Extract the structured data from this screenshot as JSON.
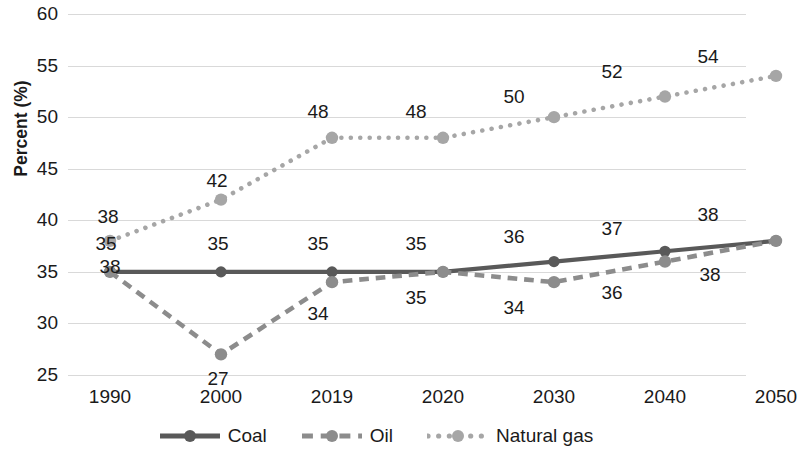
{
  "chart_data": {
    "type": "line",
    "title": "",
    "xlabel": "",
    "ylabel": "Percent (%)",
    "categories": [
      "1990",
      "2000",
      "2019",
      "2020",
      "2030",
      "2040",
      "2050"
    ],
    "ylim": [
      25,
      60
    ],
    "y_ticks": [
      25,
      30,
      35,
      40,
      45,
      50,
      55,
      60
    ],
    "grid": true,
    "legend_position": "bottom",
    "series": [
      {
        "name": "Coal",
        "style": "solid",
        "color": "#595959",
        "values": [
          35,
          35,
          35,
          35,
          36,
          37,
          38
        ],
        "labels": [
          "35",
          "35",
          "35",
          "35",
          "36",
          "37",
          "38"
        ]
      },
      {
        "name": "Oil",
        "style": "dashed",
        "color": "#8c8c8c",
        "values": [
          35,
          27,
          34,
          35,
          34,
          36,
          38
        ],
        "labels": [
          "35",
          "27",
          "34",
          "35",
          "34",
          "36",
          "38"
        ]
      },
      {
        "name": "Natural gas",
        "style": "dotted",
        "color": "#a6a6a6",
        "values": [
          38,
          42,
          48,
          48,
          50,
          52,
          54
        ],
        "labels": [
          "38",
          "42",
          "48",
          "48",
          "50",
          "52",
          "54"
        ]
      }
    ]
  },
  "axis": {
    "y_title": "Percent (%)",
    "y_tick_labels": [
      "60",
      "55",
      "50",
      "45",
      "40",
      "35",
      "30",
      "25"
    ],
    "x_tick_labels": [
      "1990",
      "2000",
      "2019",
      "2020",
      "2030",
      "2040",
      "2050"
    ]
  },
  "data_labels": [
    {
      "text": "38",
      "x": 108,
      "y": 216,
      "series": "Natural gas",
      "category": "1990"
    },
    {
      "text": "35",
      "x": 106,
      "y": 243,
      "series": "Oil",
      "category": "1990"
    },
    {
      "text": "38",
      "x": 110,
      "y": 266,
      "series": "Coal",
      "category": "1990"
    },
    {
      "text": "42",
      "x": 217,
      "y": 180,
      "series": "Natural gas",
      "category": "2000"
    },
    {
      "text": "35",
      "x": 218,
      "y": 243,
      "series": "Coal",
      "category": "2000"
    },
    {
      "text": "27",
      "x": 218,
      "y": 378,
      "series": "Oil",
      "category": "2000"
    },
    {
      "text": "48",
      "x": 318,
      "y": 111,
      "series": "Natural gas",
      "category": "2019"
    },
    {
      "text": "35",
      "x": 318,
      "y": 243,
      "series": "Coal",
      "category": "2019"
    },
    {
      "text": "34",
      "x": 318,
      "y": 313,
      "series": "Oil",
      "category": "2019"
    },
    {
      "text": "48",
      "x": 416,
      "y": 111,
      "series": "Natural gas",
      "category": "2020"
    },
    {
      "text": "35",
      "x": 416,
      "y": 243,
      "series": "Coal",
      "category": "2020"
    },
    {
      "text": "35",
      "x": 416,
      "y": 297,
      "series": "Oil",
      "category": "2020"
    },
    {
      "text": "50",
      "x": 514,
      "y": 96,
      "series": "Natural gas",
      "category": "2030"
    },
    {
      "text": "36",
      "x": 514,
      "y": 236,
      "series": "Coal",
      "category": "2030"
    },
    {
      "text": "34",
      "x": 514,
      "y": 307,
      "series": "Oil",
      "category": "2030"
    },
    {
      "text": "52",
      "x": 612,
      "y": 71,
      "series": "Natural gas",
      "category": "2040"
    },
    {
      "text": "37",
      "x": 612,
      "y": 228,
      "series": "Coal",
      "category": "2040"
    },
    {
      "text": "36",
      "x": 612,
      "y": 292,
      "series": "Oil",
      "category": "2040"
    },
    {
      "text": "54",
      "x": 708,
      "y": 56,
      "series": "Natural gas",
      "category": "2050"
    },
    {
      "text": "38",
      "x": 708,
      "y": 214,
      "series": "Coal",
      "category": "2050"
    },
    {
      "text": "38",
      "x": 710,
      "y": 274,
      "series": "Oil",
      "category": "2050"
    }
  ],
  "legend": {
    "items": [
      {
        "label": "Coal",
        "style": "solid",
        "color": "#595959"
      },
      {
        "label": "Oil",
        "style": "dashed",
        "color": "#8c8c8c"
      },
      {
        "label": "Natural gas",
        "style": "dotted",
        "color": "#a6a6a6"
      }
    ]
  }
}
